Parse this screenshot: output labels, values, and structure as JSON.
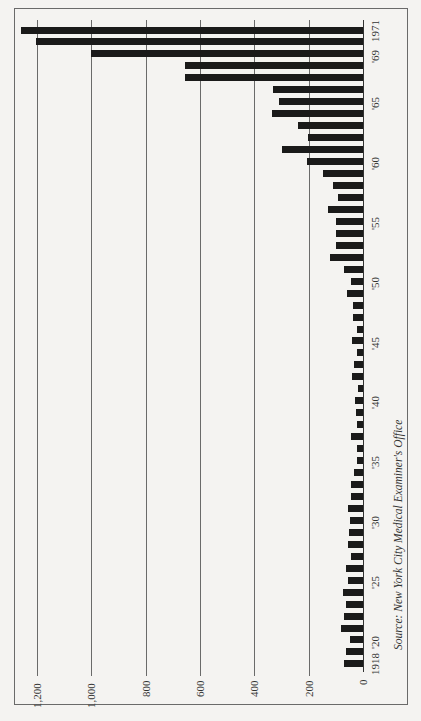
{
  "chart_data": {
    "type": "bar",
    "orientation": "horizontal (rotated page, bars extend left from baseline)",
    "title": "",
    "source": "Source: New York City Medical Examiner's Office",
    "xlabel": "",
    "ylabel": "",
    "value_axis": {
      "range": [
        0,
        1200
      ],
      "ticks": [
        0,
        200,
        400,
        600,
        800,
        1000,
        1200
      ],
      "tick_labels": [
        "0",
        "200",
        "400",
        "600",
        "800",
        "1,000",
        "1,200"
      ],
      "grid": true
    },
    "category_axis": {
      "tick_labels": [
        {
          "year": 1918,
          "label": "1918"
        },
        {
          "year": 1920,
          "label": "'20"
        },
        {
          "year": 1925,
          "label": "'25"
        },
        {
          "year": 1930,
          "label": "'30"
        },
        {
          "year": 1935,
          "label": "'35"
        },
        {
          "year": 1940,
          "label": "'40"
        },
        {
          "year": 1945,
          "label": "'45"
        },
        {
          "year": 1950,
          "label": "'50"
        },
        {
          "year": 1955,
          "label": "'55"
        },
        {
          "year": 1960,
          "label": "'60"
        },
        {
          "year": 1965,
          "label": "'65"
        },
        {
          "year": 1969,
          "label": "'69"
        },
        {
          "year": 1971,
          "label": "1971"
        }
      ]
    },
    "categories": [
      1918,
      1919,
      1920,
      1921,
      1922,
      1923,
      1924,
      1925,
      1926,
      1927,
      1928,
      1929,
      1930,
      1931,
      1932,
      1933,
      1934,
      1935,
      1936,
      1937,
      1938,
      1939,
      1940,
      1941,
      1942,
      1943,
      1944,
      1945,
      1946,
      1947,
      1948,
      1949,
      1950,
      1951,
      1952,
      1953,
      1954,
      1955,
      1956,
      1957,
      1958,
      1959,
      1960,
      1961,
      1962,
      1963,
      1964,
      1965,
      1966,
      1967,
      1968,
      1969,
      1970,
      1971
    ],
    "values": [
      70,
      63,
      48,
      81,
      70,
      63,
      74,
      55,
      63,
      44,
      55,
      52,
      48,
      55,
      44,
      44,
      33,
      22,
      22,
      44,
      22,
      26,
      30,
      18,
      40,
      33,
      22,
      40,
      22,
      37,
      37,
      59,
      44,
      70,
      121,
      99,
      99,
      99,
      129,
      92,
      110,
      147,
      206,
      298,
      202,
      239,
      335,
      309,
      331,
      655,
      655,
      1000,
      1205,
      1260
    ]
  },
  "colors": {
    "bar": "#1a1a1a",
    "grid": "#6a6a6a",
    "background": "#f4f3f1"
  }
}
